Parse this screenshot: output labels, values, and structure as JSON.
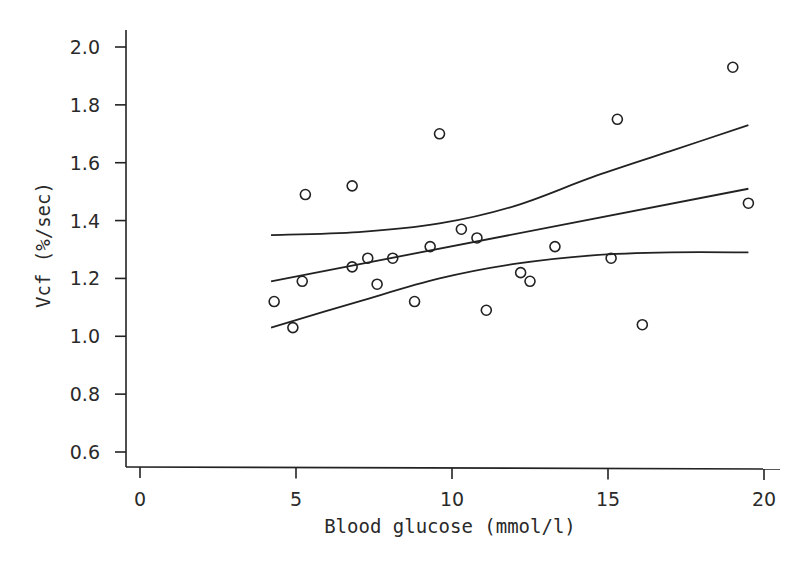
{
  "chart_data": {
    "type": "scatter",
    "title": "",
    "xlabel": "Blood glucose (mmol/l)",
    "ylabel": "Vcf (%/sec)",
    "xlim": [
      -0.5,
      20.5
    ],
    "ylim": [
      0.55,
      2.05
    ],
    "x_ticks": [
      0,
      5,
      10,
      15,
      20
    ],
    "x_tick_labels": [
      "0",
      "5",
      "10",
      "15",
      "20"
    ],
    "y_ticks": [
      0.6,
      0.8,
      1.0,
      1.2,
      1.4,
      1.6,
      1.8,
      2.0
    ],
    "y_tick_labels": [
      "0.6",
      "0.8",
      "1.0",
      "1.2",
      "1.4",
      "1.6",
      "1.8",
      "2.0"
    ],
    "grid": false,
    "legend": null,
    "series": [
      {
        "name": "observations",
        "marker": "open-circle",
        "points": [
          [
            4.3,
            1.12
          ],
          [
            4.9,
            1.03
          ],
          [
            5.2,
            1.19
          ],
          [
            5.3,
            1.49
          ],
          [
            6.8,
            1.52
          ],
          [
            6.8,
            1.24
          ],
          [
            7.3,
            1.27
          ],
          [
            7.6,
            1.18
          ],
          [
            8.1,
            1.27
          ],
          [
            8.8,
            1.12
          ],
          [
            9.3,
            1.31
          ],
          [
            9.6,
            1.7
          ],
          [
            10.3,
            1.37
          ],
          [
            10.8,
            1.34
          ],
          [
            11.1,
            1.09
          ],
          [
            12.2,
            1.22
          ],
          [
            12.5,
            1.19
          ],
          [
            13.3,
            1.31
          ],
          [
            15.1,
            1.27
          ],
          [
            15.3,
            1.75
          ],
          [
            16.1,
            1.04
          ],
          [
            19.0,
            1.93
          ],
          [
            19.5,
            1.46
          ]
        ]
      },
      {
        "name": "regression line",
        "style": "line",
        "points": [
          [
            4.2,
            1.19
          ],
          [
            19.5,
            1.51
          ]
        ]
      },
      {
        "name": "upper 95% confidence band",
        "style": "curve",
        "points": [
          [
            4.2,
            1.35
          ],
          [
            7.0,
            1.36
          ],
          [
            9.6,
            1.39
          ],
          [
            12.0,
            1.45
          ],
          [
            14.5,
            1.55
          ],
          [
            17.0,
            1.64
          ],
          [
            19.5,
            1.73
          ]
        ]
      },
      {
        "name": "lower 95% confidence band",
        "style": "curve",
        "points": [
          [
            4.2,
            1.03
          ],
          [
            7.0,
            1.12
          ],
          [
            9.6,
            1.2
          ],
          [
            12.0,
            1.25
          ],
          [
            14.5,
            1.28
          ],
          [
            17.0,
            1.29
          ],
          [
            19.5,
            1.29
          ]
        ]
      }
    ]
  }
}
